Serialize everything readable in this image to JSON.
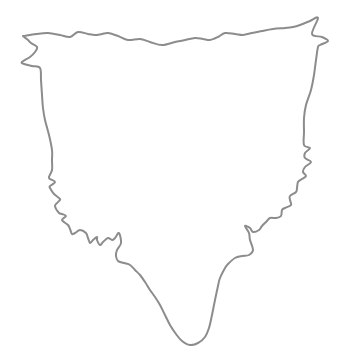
{
  "drawing": {
    "subject": "hide-outline",
    "background": "#ffffff",
    "stroke_color": "#8c8c8c",
    "stroke_width": 2,
    "points": [
      [
        23,
        36
      ],
      [
        36,
        34
      ],
      [
        48,
        33
      ],
      [
        60,
        35
      ],
      [
        70,
        37
      ],
      [
        78,
        32
      ],
      [
        88,
        34
      ],
      [
        95,
        35
      ],
      [
        102,
        34
      ],
      [
        108,
        33
      ],
      [
        118,
        36
      ],
      [
        128,
        40
      ],
      [
        140,
        39
      ],
      [
        150,
        42
      ],
      [
        162,
        45
      ],
      [
        175,
        42
      ],
      [
        185,
        40
      ],
      [
        195,
        38
      ],
      [
        203,
        39
      ],
      [
        210,
        40
      ],
      [
        218,
        37
      ],
      [
        225,
        33
      ],
      [
        235,
        34
      ],
      [
        243,
        35
      ],
      [
        252,
        33
      ],
      [
        262,
        31
      ],
      [
        273,
        29
      ],
      [
        285,
        28
      ],
      [
        293,
        27
      ],
      [
        300,
        25
      ],
      [
        310,
        21
      ],
      [
        318,
        18
      ],
      [
        312,
        34
      ],
      [
        322,
        37
      ],
      [
        328,
        41
      ],
      [
        320,
        45
      ],
      [
        318,
        47
      ],
      [
        316,
        60
      ],
      [
        314,
        75
      ],
      [
        311,
        90
      ],
      [
        306,
        105
      ],
      [
        304,
        118
      ],
      [
        304,
        132
      ],
      [
        304,
        145
      ],
      [
        310,
        148
      ],
      [
        305,
        153
      ],
      [
        305,
        158
      ],
      [
        311,
        162
      ],
      [
        305,
        167
      ],
      [
        303,
        172
      ],
      [
        306,
        176
      ],
      [
        302,
        179
      ],
      [
        298,
        182
      ],
      [
        297,
        188
      ],
      [
        296,
        192
      ],
      [
        290,
        196
      ],
      [
        290,
        200
      ],
      [
        291,
        205
      ],
      [
        285,
        208
      ],
      [
        282,
        210
      ],
      [
        281,
        216
      ],
      [
        276,
        218
      ],
      [
        270,
        218
      ],
      [
        266,
        222
      ],
      [
        262,
        226
      ],
      [
        259,
        230
      ],
      [
        253,
        232
      ],
      [
        250,
        228
      ],
      [
        245,
        226
      ],
      [
        249,
        233
      ],
      [
        250,
        240
      ],
      [
        253,
        250
      ],
      [
        249,
        255
      ],
      [
        242,
        256
      ],
      [
        235,
        258
      ],
      [
        228,
        264
      ],
      [
        225,
        268
      ],
      [
        220,
        278
      ],
      [
        218,
        286
      ],
      [
        215,
        300
      ],
      [
        212,
        315
      ],
      [
        209,
        328
      ],
      [
        205,
        337
      ],
      [
        198,
        343
      ],
      [
        190,
        345
      ],
      [
        182,
        341
      ],
      [
        176,
        334
      ],
      [
        170,
        325
      ],
      [
        165,
        315
      ],
      [
        160,
        305
      ],
      [
        155,
        297
      ],
      [
        150,
        290
      ],
      [
        145,
        282
      ],
      [
        140,
        275
      ],
      [
        135,
        270
      ],
      [
        130,
        265
      ],
      [
        124,
        263
      ],
      [
        118,
        261
      ],
      [
        116,
        256
      ],
      [
        117,
        250
      ],
      [
        121,
        243
      ],
      [
        119,
        233
      ],
      [
        115,
        238
      ],
      [
        112,
        240
      ],
      [
        108,
        238
      ],
      [
        103,
        242
      ],
      [
        100,
        245
      ],
      [
        97,
        240
      ],
      [
        97,
        237
      ],
      [
        93,
        240
      ],
      [
        90,
        243
      ],
      [
        88,
        238
      ],
      [
        86,
        233
      ],
      [
        80,
        230
      ],
      [
        75,
        233
      ],
      [
        72,
        234
      ],
      [
        70,
        229
      ],
      [
        68,
        225
      ],
      [
        62,
        220
      ],
      [
        66,
        216
      ],
      [
        62,
        214
      ],
      [
        59,
        213
      ],
      [
        55,
        206
      ],
      [
        58,
        202
      ],
      [
        60,
        199
      ],
      [
        54,
        194
      ],
      [
        50,
        188
      ],
      [
        50,
        186
      ],
      [
        55,
        182
      ],
      [
        50,
        179
      ],
      [
        49,
        177
      ],
      [
        52,
        170
      ],
      [
        52,
        160
      ],
      [
        52,
        150
      ],
      [
        49,
        135
      ],
      [
        45,
        120
      ],
      [
        43,
        108
      ],
      [
        42,
        95
      ],
      [
        41,
        80
      ],
      [
        40,
        68
      ],
      [
        32,
        66
      ],
      [
        24,
        64
      ],
      [
        22,
        62
      ],
      [
        30,
        57
      ],
      [
        35,
        52
      ],
      [
        37,
        47
      ],
      [
        31,
        43
      ],
      [
        28,
        40
      ],
      [
        23,
        36
      ]
    ]
  }
}
